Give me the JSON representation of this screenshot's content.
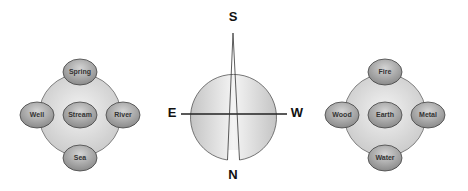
{
  "left_diagram": {
    "nodes": {
      "top": "Spring",
      "left": "Well",
      "center": "Stream",
      "right": "River",
      "bottom": "Sea"
    }
  },
  "compass": {
    "top": "S",
    "bottom": "N",
    "left": "E",
    "right": "W"
  },
  "right_diagram": {
    "nodes": {
      "top": "Fire",
      "left": "Wood",
      "center": "Earth",
      "right": "Metal",
      "bottom": "Water"
    }
  },
  "colors": {
    "background": "#ffffff",
    "disc_fill": "#dcdcdc",
    "node_fill": "#a8a8a8",
    "stroke": "#555555",
    "line": "#222222"
  }
}
